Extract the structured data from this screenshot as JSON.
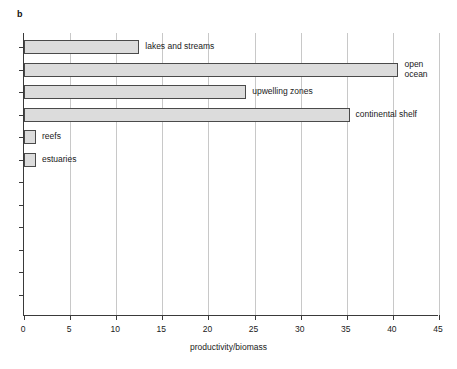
{
  "panel": {
    "letter": "b"
  },
  "chart_data": {
    "type": "bar",
    "orientation": "horizontal",
    "title": "",
    "subtitle": "",
    "xlabel": "productivity/biomass",
    "ylabel": "",
    "xlim": [
      0,
      45
    ],
    "xticks": [
      0,
      5,
      10,
      15,
      20,
      25,
      30,
      35,
      40,
      45
    ],
    "xtick_labels": [
      "0",
      "5",
      "10",
      "15",
      "20",
      "25",
      "30",
      "35",
      "40",
      "45"
    ],
    "grid": "vertical",
    "legend": "none",
    "bar_fill": "#dcdcdc",
    "bar_edge": "#4a4a4a",
    "categories": [
      "lakes and streams",
      "open ocean",
      "upwelling zones",
      "continental shelf",
      "reefs",
      "estuaries"
    ],
    "values": [
      12.5,
      40.6,
      24.1,
      35.3,
      1.3,
      1.3
    ],
    "bars": [
      {
        "label": "lakes and streams",
        "value": 12.5,
        "label_text": "lakes and streams"
      },
      {
        "label": "open ocean",
        "value": 40.6,
        "label_text": "open\nocean"
      },
      {
        "label": "upwelling zones",
        "value": 24.1,
        "label_text": "upwelling zones"
      },
      {
        "label": "continental shelf",
        "value": 35.3,
        "label_text": "continental shelf"
      },
      {
        "label": "reefs",
        "value": 1.3,
        "label_text": "reefs"
      },
      {
        "label": "estuaries",
        "value": 1.3,
        "label_text": "estuaries"
      }
    ],
    "empty_category_slots": 6
  }
}
